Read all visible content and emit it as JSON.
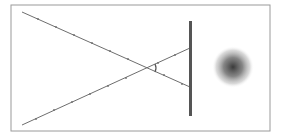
{
  "diagram": {
    "title": "",
    "colors": {
      "frame": "#9a9a9a",
      "ray": "#6e6e6e",
      "screen": "#555555",
      "spot_center": "#3a3a3a",
      "background": "#ffffff"
    },
    "elements": {
      "frame": {
        "x": 11,
        "y": 5,
        "w": 259,
        "h": 126
      },
      "ray_upper": {
        "x1": 22,
        "y1": 12,
        "x2": 190,
        "y2": 87
      },
      "ray_lower": {
        "x1": 22,
        "y1": 125,
        "x2": 190,
        "y2": 48
      },
      "screen": {
        "x": 190,
        "y1": 21,
        "y2": 116,
        "width": 3
      },
      "angle_marker": {
        "x": 155,
        "y1": 64,
        "y2": 72
      },
      "blur_spot": {
        "cx": 233,
        "cy": 67,
        "r": 21
      }
    }
  }
}
